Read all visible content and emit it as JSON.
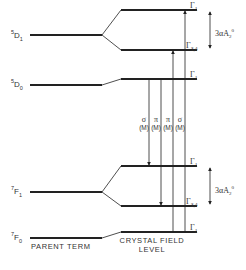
{
  "diagram": {
    "type": "energy-level-diagram",
    "parent_terms": [
      {
        "id": "5D1",
        "mult": "5",
        "letter": "D",
        "j": "1"
      },
      {
        "id": "5D0",
        "mult": "5",
        "letter": "D",
        "j": "0"
      },
      {
        "id": "7F1",
        "mult": "7",
        "letter": "F",
        "j": "1"
      },
      {
        "id": "7F0",
        "mult": "7",
        "letter": "F",
        "j": "0"
      }
    ],
    "crystal_field_levels": [
      {
        "parent": "5D1",
        "symbol": "Γ",
        "sub": "1"
      },
      {
        "parent": "5D1",
        "symbol": "Γ",
        "sub": "3,4"
      },
      {
        "parent": "5D0",
        "symbol": "Γ",
        "sub": "1"
      },
      {
        "parent": "7F1",
        "symbol": "Γ",
        "sub": "1"
      },
      {
        "parent": "7F1",
        "symbol": "Γ",
        "sub": "3,4"
      },
      {
        "parent": "7F0",
        "symbol": "Γ",
        "sub": "1"
      }
    ],
    "transitions": [
      {
        "pol": "σ",
        "type": "(M)",
        "direction": "down",
        "from": "5D0 Γ1",
        "to": "7F1 Γ1"
      },
      {
        "pol": "π",
        "type": "(M)",
        "direction": "down",
        "from": "5D0 Γ1",
        "to": "7F1 Γ3,4"
      },
      {
        "pol": "π",
        "type": "(M)",
        "direction": "up",
        "from": "7F0 Γ1",
        "to": "5D1 Γ3,4"
      },
      {
        "pol": "σ",
        "type": "(M)",
        "direction": "up",
        "from": "7F0 Γ1",
        "to": "5D1 Γ1"
      }
    ],
    "splittings": [
      {
        "coef": "3",
        "symbol": "α",
        "A": "A",
        "sub": "2",
        "sup": "0"
      },
      {
        "coef": "3",
        "symbol": "α",
        "A": "A",
        "sub": "2",
        "sup": "0"
      }
    ],
    "captions": {
      "parent": "PARENT TERM",
      "crystal_field_1": "CRYSTAL FIELD",
      "crystal_field_2": "LEVEL"
    }
  }
}
